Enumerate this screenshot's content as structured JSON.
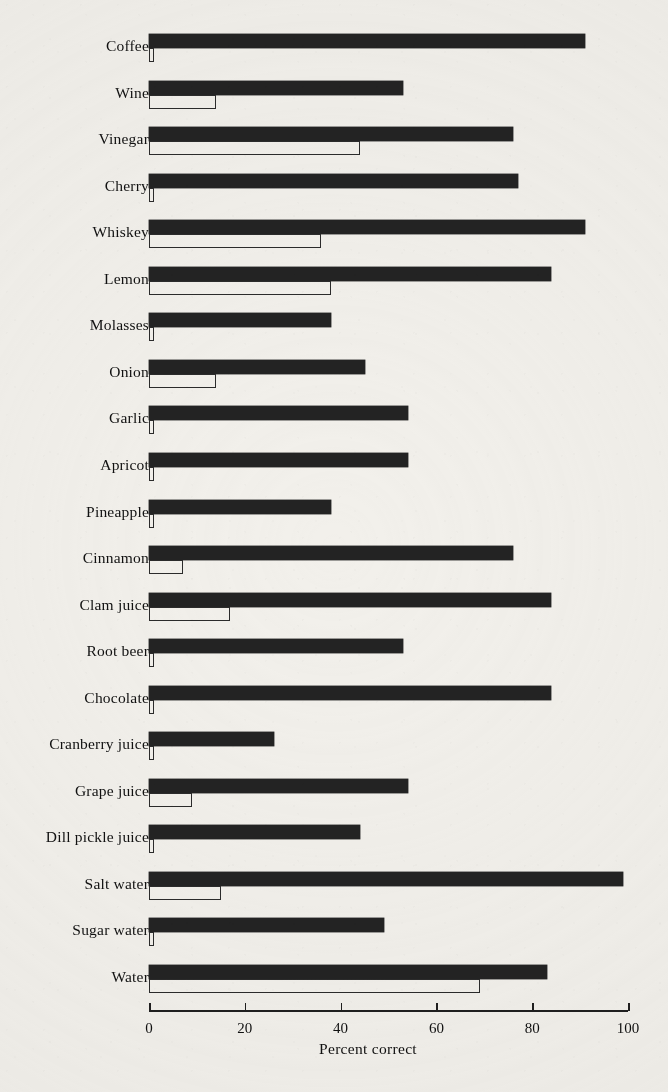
{
  "chart_data": {
    "type": "bar",
    "orientation": "horizontal",
    "title": "",
    "xlabel": "Percent correct",
    "ylabel": "",
    "xlim": [
      0,
      100
    ],
    "xticks": [
      0,
      20,
      40,
      60,
      80,
      100
    ],
    "xtick_labels": [
      "0",
      "20",
      "40",
      "60",
      "80",
      "100"
    ],
    "grid": false,
    "legend": null,
    "categories": [
      "Coffee",
      "Wine",
      "Vinegar",
      "Cherry",
      "Whiskey",
      "Lemon",
      "Molasses",
      "Onion",
      "Garlic",
      "Apricot",
      "Pineapple",
      "Cinnamon",
      "Clam juice",
      "Root beer",
      "Chocolate",
      "Cranberry juice",
      "Grape juice",
      "Dill pickle juice",
      "Salt water",
      "Sugar water",
      "Water"
    ],
    "series": [
      {
        "name": "solid",
        "style": "filled-black",
        "values": [
          91,
          53,
          76,
          77,
          91,
          84,
          38,
          45,
          54,
          54,
          38,
          76,
          84,
          53,
          84,
          26,
          54,
          44,
          99,
          49,
          83
        ]
      },
      {
        "name": "open",
        "style": "outline",
        "values": [
          1,
          14,
          44,
          1,
          36,
          38,
          1,
          14,
          1,
          1,
          1,
          7,
          17,
          1,
          1,
          1,
          9,
          1,
          15,
          1,
          69
        ]
      }
    ]
  },
  "axis": {
    "x_label": "Percent correct",
    "tick_labels": [
      "0",
      "20",
      "40",
      "60",
      "80",
      "100"
    ]
  },
  "colors": {
    "background": "#f2f0eb",
    "bar_solid": "#232323",
    "bar_open_border": "#2b2b2b",
    "axis": "#1f1f1f",
    "text": "#111111"
  }
}
